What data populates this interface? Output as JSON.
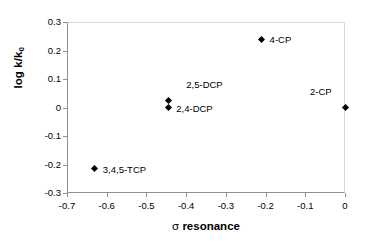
{
  "chart_data": {
    "type": "scatter",
    "title": "",
    "xlabel": "σ resonance",
    "ylabel": "log k/k0",
    "ylabel_main": "log k/k",
    "ylabel_sub": "0",
    "xlabel_symbol": "σ",
    "xlabel_word": "resonance",
    "xlim": [
      -0.7,
      0
    ],
    "ylim": [
      -0.3,
      0.3
    ],
    "xticks": [
      -0.7,
      -0.6,
      -0.5,
      -0.4,
      -0.3,
      -0.2,
      -0.1,
      0
    ],
    "xtick_labels": [
      "-0.7",
      "-0.6",
      "-0.5",
      "-0.4",
      "-0.3",
      "-0.2",
      "-0.1",
      "0"
    ],
    "yticks": [
      0.3,
      0.2,
      0.1,
      0,
      -0.1,
      -0.2,
      -0.3
    ],
    "ytick_labels": [
      "0.3",
      "0.2",
      "0.1",
      "0",
      "-0.1",
      "-0.2",
      "-0.3"
    ],
    "grid": false,
    "legend": false,
    "marker_shape": "diamond",
    "marker_color": "#000000",
    "points": [
      {
        "label": "3,4,5-TCP",
        "x": -0.63,
        "y": -0.215,
        "label_dx": 8,
        "label_dy": -4
      },
      {
        "label": "2,4-DCP",
        "x": -0.445,
        "y": 0.0,
        "label_dx": 8,
        "label_dy": -4
      },
      {
        "label": "2,5-DCP",
        "x": -0.445,
        "y": 0.025,
        "label_dx": 18,
        "label_dy": -20
      },
      {
        "label": "4-CP",
        "x": -0.21,
        "y": 0.24,
        "label_dx": 8,
        "label_dy": -4
      },
      {
        "label": "2-CP",
        "x": 0.0,
        "y": 0.0,
        "label_dx": -35,
        "label_dy": -21
      }
    ]
  }
}
